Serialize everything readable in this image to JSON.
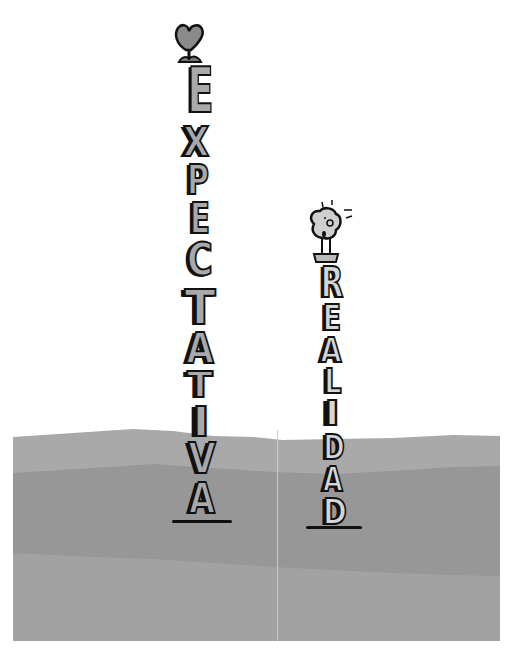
{
  "illustration": {
    "left_tower": {
      "word": "EXPECTATIVA",
      "letters": [
        "E",
        "X",
        "P",
        "E",
        "C",
        "T",
        "A",
        "T",
        "I",
        "V",
        "A"
      ],
      "topper": "heart-icon"
    },
    "right_tower": {
      "word": "REALIDAD",
      "letters": [
        "R",
        "E",
        "A",
        "L",
        "I",
        "D",
        "A",
        "D"
      ],
      "topper": "small-person-head-icon"
    },
    "colors": {
      "background": "#ffffff",
      "ground_top": "#a9a9a9",
      "ground_middle": "#979797",
      "ground_bottom": "#a2a2a2",
      "left_letters": "#a9a9a9",
      "right_letters": "#d6d6d6",
      "outline": "#111111"
    }
  }
}
